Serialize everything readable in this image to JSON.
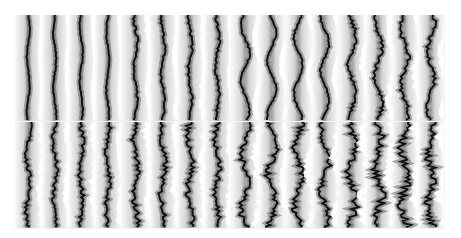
{
  "figure": {
    "rows": 2,
    "cols": 4,
    "panels": [
      {
        "row": 0,
        "col": 0,
        "stripes": 4,
        "waviness": 3,
        "noise": 0.5
      },
      {
        "row": 0,
        "col": 1,
        "stripes": 4,
        "waviness": 4,
        "noise": 1.2
      },
      {
        "row": 0,
        "col": 2,
        "stripes": 4,
        "waviness": 9,
        "noise": 0.8
      },
      {
        "row": 0,
        "col": 3,
        "stripes": 4,
        "waviness": 8,
        "noise": 1.8
      },
      {
        "row": 1,
        "col": 0,
        "stripes": 4,
        "waviness": 4,
        "noise": 2.0
      },
      {
        "row": 1,
        "col": 1,
        "stripes": 4,
        "waviness": 5,
        "noise": 2.5
      },
      {
        "row": 1,
        "col": 2,
        "stripes": 4,
        "waviness": 9,
        "noise": 3.0
      },
      {
        "row": 1,
        "col": 3,
        "stripes": 4,
        "waviness": 8,
        "noise": 4.0
      }
    ],
    "colors": {
      "background": "#ffffff",
      "dark": "#111111",
      "light": "#ffffff",
      "mid": "#9a9a9a"
    }
  }
}
